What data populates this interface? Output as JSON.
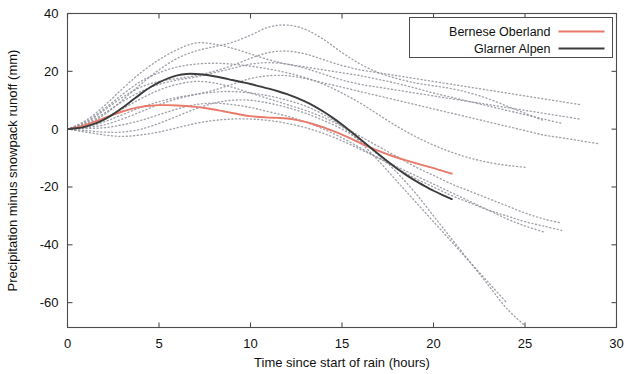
{
  "chart_data": {
    "type": "line",
    "title": "",
    "xlabel": "Time since start of rain (hours)",
    "ylabel": "Precipitation minus snowpack runoff (mm)",
    "xlim": [
      0,
      30
    ],
    "ylim": [
      -68.6,
      40
    ],
    "xticks": [
      0,
      5,
      10,
      15,
      20,
      25,
      30
    ],
    "xtick_labels": [
      "0",
      "5",
      "10",
      "15",
      "20",
      "25",
      "30"
    ],
    "yticks": [
      40,
      20,
      0,
      -20,
      -40,
      -60
    ],
    "ytick_labels": [
      "40",
      "20",
      "0",
      "-20",
      "-40",
      "-60"
    ],
    "grid": false,
    "legend_position": "top-right",
    "legend": [
      {
        "label": "Bernese Oberland",
        "color": "#e8796b",
        "style": "solid"
      },
      {
        "label": "Glarner Alpen",
        "color": "#3c3c3c",
        "style": "solid"
      }
    ],
    "series": [
      {
        "name": "Bernese Oberland",
        "role": "mean",
        "color": "#e8796b",
        "style": "solid",
        "width": 1.9,
        "x": [
          0,
          0.5,
          1,
          1.5,
          2,
          2.5,
          3,
          3.5,
          4,
          4.5,
          5,
          5.5,
          6,
          6.5,
          7,
          7.5,
          8,
          8.5,
          9,
          9.5,
          10,
          10.5,
          11,
          11.5,
          12,
          12.5,
          13,
          13.5,
          14,
          14.5,
          15,
          15.5,
          16,
          16.5,
          17,
          17.5,
          18,
          18.5,
          19,
          19.5,
          20,
          20.5,
          21
        ],
        "y": [
          0.0,
          0.6,
          1.5,
          2.6,
          3.8,
          5.0,
          6.1,
          7.0,
          7.7,
          8.1,
          8.3,
          8.3,
          8.2,
          8.0,
          7.7,
          7.3,
          6.8,
          6.2,
          5.6,
          5.0,
          4.5,
          4.2,
          4.0,
          3.9,
          3.7,
          3.2,
          2.5,
          1.6,
          0.6,
          -0.6,
          -1.9,
          -3.3,
          -4.8,
          -6.2,
          -7.5,
          -8.7,
          -9.8,
          -10.8,
          -11.7,
          -12.6,
          -13.5,
          -14.4,
          -15.4
        ]
      },
      {
        "name": "Glarner Alpen",
        "role": "mean",
        "color": "#3c3c3c",
        "style": "solid",
        "width": 1.9,
        "x": [
          0,
          0.5,
          1,
          1.5,
          2,
          2.5,
          3,
          3.5,
          4,
          4.5,
          5,
          5.5,
          6,
          6.5,
          7,
          7.5,
          8,
          8.5,
          9,
          9.5,
          10,
          10.5,
          11,
          11.5,
          12,
          12.5,
          13,
          13.5,
          14,
          14.5,
          15,
          15.5,
          16,
          16.5,
          17,
          17.5,
          18,
          18.5,
          19,
          19.5,
          20,
          20.5,
          21
        ],
        "y": [
          0.0,
          0.3,
          0.9,
          1.9,
          3.3,
          5.2,
          7.4,
          9.8,
          12.2,
          14.4,
          16.2,
          17.6,
          18.6,
          19.1,
          19.1,
          18.8,
          18.3,
          17.7,
          17.0,
          16.3,
          15.6,
          14.8,
          14.0,
          13.1,
          12.1,
          10.9,
          9.5,
          7.9,
          6.0,
          3.9,
          1.6,
          -0.9,
          -3.5,
          -6.1,
          -8.7,
          -11.2,
          -13.6,
          -15.8,
          -17.8,
          -19.6,
          -21.3,
          -22.8,
          -24.2
        ]
      },
      {
        "name": "ensemble-member-1",
        "role": "ensemble",
        "color": "#8c8f99",
        "style": "dotted",
        "width": 1.35,
        "x": [
          0,
          1,
          2,
          3,
          4,
          5,
          6,
          7,
          8,
          9,
          10,
          11,
          12,
          13,
          14,
          15,
          16,
          17,
          18,
          19,
          20,
          21,
          22,
          23,
          24,
          25,
          26,
          27
        ],
        "y": [
          0.0,
          3.0,
          8.0,
          14.0,
          19.5,
          24.0,
          27.5,
          29.8,
          29.4,
          28.0,
          26.0,
          24.0,
          22.5,
          21.5,
          20.5,
          19.5,
          18.5,
          17.2,
          15.8,
          14.2,
          12.5,
          11.0,
          9.5,
          8.0,
          6.5,
          5.0,
          3.5,
          2.0
        ]
      },
      {
        "name": "ensemble-member-2",
        "role": "ensemble",
        "color": "#8c8f99",
        "style": "dotted",
        "width": 1.35,
        "x": [
          0,
          1,
          2,
          3,
          4,
          5,
          6,
          7,
          8,
          9,
          10,
          11,
          12,
          13,
          14,
          15,
          16,
          17,
          18,
          19,
          20,
          21,
          22,
          23,
          24,
          25,
          26
        ],
        "y": [
          0.0,
          1.5,
          5.0,
          10.0,
          15.5,
          20.5,
          24.5,
          27.0,
          28.5,
          30.0,
          32.5,
          35.3,
          36.0,
          34.5,
          31.0,
          26.5,
          22.5,
          19.5,
          17.5,
          16.0,
          15.0,
          14.0,
          12.5,
          10.5,
          8.0,
          5.5,
          3.0
        ]
      },
      {
        "name": "ensemble-member-3",
        "role": "ensemble",
        "color": "#8c8f99",
        "style": "dotted",
        "width": 1.35,
        "x": [
          0,
          1,
          2,
          3,
          4,
          5,
          6,
          7,
          8,
          9,
          10,
          11,
          12,
          13,
          14,
          15,
          16,
          17,
          18,
          19,
          20,
          21,
          22,
          23,
          24,
          25
        ],
        "y": [
          0.0,
          2.5,
          7.0,
          12.0,
          16.5,
          19.5,
          21.5,
          22.5,
          22.8,
          22.5,
          21.8,
          20.8,
          19.5,
          17.8,
          15.5,
          12.5,
          9.0,
          5.0,
          1.0,
          -2.5,
          -5.5,
          -8.0,
          -10.0,
          -11.5,
          -12.5,
          -13.2
        ]
      },
      {
        "name": "ensemble-member-4",
        "role": "ensemble",
        "color": "#8c8f99",
        "style": "dotted",
        "width": 1.35,
        "x": [
          0,
          1,
          2,
          3,
          4,
          5,
          6,
          7,
          8,
          9,
          10,
          11,
          12,
          13,
          14,
          15,
          16,
          17,
          18,
          19,
          20,
          21,
          22,
          23,
          24,
          25,
          26,
          27
        ],
        "y": [
          0.0,
          1.0,
          3.5,
          7.0,
          10.5,
          13.5,
          15.5,
          16.5,
          16.0,
          14.5,
          12.5,
          10.5,
          8.5,
          6.5,
          4.0,
          1.0,
          -2.5,
          -6.0,
          -9.5,
          -13.0,
          -16.0,
          -19.0,
          -21.5,
          -24.0,
          -26.5,
          -29.0,
          -31.0,
          -32.5
        ]
      },
      {
        "name": "ensemble-member-5",
        "role": "ensemble",
        "color": "#8c8f99",
        "style": "dotted",
        "width": 1.35,
        "x": [
          0,
          1,
          2,
          3,
          4,
          5,
          6,
          7,
          8,
          9,
          10,
          11,
          12,
          13,
          14,
          15,
          16,
          17,
          18,
          19,
          20,
          21,
          22,
          23,
          24
        ],
        "y": [
          0.0,
          0.5,
          1.5,
          3.5,
          6.0,
          8.5,
          10.5,
          12.0,
          12.8,
          13.0,
          12.5,
          11.5,
          10.0,
          8.0,
          5.0,
          1.0,
          -4.5,
          -11.0,
          -18.0,
          -25.0,
          -32.0,
          -39.0,
          -46.0,
          -53.0,
          -60.0
        ]
      },
      {
        "name": "ensemble-member-6",
        "role": "ensemble",
        "color": "#8c8f99",
        "style": "dotted",
        "width": 1.35,
        "x": [
          0,
          1,
          2,
          3,
          4,
          5,
          6,
          7,
          8,
          9,
          10,
          11,
          12,
          13,
          14,
          15,
          16,
          17,
          18,
          19,
          20,
          21,
          22,
          23,
          24,
          25
        ],
        "y": [
          0.0,
          -0.5,
          -1.0,
          -1.0,
          0.0,
          2.0,
          4.5,
          7.0,
          9.0,
          10.0,
          10.0,
          9.0,
          7.5,
          5.5,
          3.0,
          0.0,
          -4.0,
          -9.0,
          -15.0,
          -22.0,
          -30.0,
          -38.0,
          -46.0,
          -54.0,
          -62.0,
          -68.0
        ]
      },
      {
        "name": "ensemble-member-7",
        "role": "ensemble",
        "color": "#8c8f99",
        "style": "dotted",
        "width": 1.35,
        "x": [
          0,
          1,
          2,
          3,
          4,
          5,
          6,
          7,
          8,
          9,
          10,
          11,
          12,
          13,
          14,
          15,
          16,
          17,
          18,
          19,
          20,
          21,
          22,
          23,
          24,
          25,
          26
        ],
        "y": [
          0.0,
          -1.0,
          -2.0,
          -2.5,
          -2.0,
          -1.0,
          0.5,
          2.0,
          3.0,
          3.5,
          3.5,
          3.0,
          2.0,
          0.5,
          -1.5,
          -4.0,
          -7.0,
          -10.0,
          -13.0,
          -16.0,
          -19.0,
          -22.0,
          -25.0,
          -28.0,
          -31.0,
          -33.5,
          -35.5
        ]
      },
      {
        "name": "ensemble-member-8",
        "role": "ensemble",
        "color": "#8c8f99",
        "style": "dotted",
        "width": 1.35,
        "x": [
          0,
          1,
          2,
          3,
          4,
          5,
          6,
          7,
          8,
          9,
          10,
          11,
          12,
          13,
          14,
          15,
          16,
          17,
          18,
          19,
          20,
          21,
          22,
          23,
          24,
          25,
          26,
          27,
          28
        ],
        "y": [
          0.0,
          1.8,
          5.5,
          9.5,
          13.0,
          15.5,
          17.0,
          18.0,
          19.5,
          21.0,
          22.5,
          23.0,
          22.5,
          21.0,
          19.0,
          17.0,
          15.5,
          14.5,
          13.5,
          12.5,
          11.5,
          10.5,
          9.5,
          8.5,
          7.5,
          6.5,
          5.5,
          4.5,
          3.5
        ]
      },
      {
        "name": "ensemble-member-9",
        "role": "ensemble",
        "color": "#8c8f99",
        "style": "dotted",
        "width": 1.35,
        "x": [
          0,
          1,
          2,
          3,
          4,
          5,
          6,
          7,
          8,
          9,
          10,
          11,
          12,
          13,
          14,
          15,
          16,
          17,
          18,
          19,
          20,
          21,
          22,
          23,
          24,
          25,
          26,
          27,
          28,
          29
        ],
        "y": [
          0.0,
          0.8,
          2.5,
          5.0,
          7.5,
          9.5,
          11.0,
          12.0,
          13.5,
          15.5,
          17.5,
          18.5,
          18.5,
          17.5,
          16.0,
          14.5,
          13.0,
          11.5,
          10.0,
          8.5,
          7.0,
          5.5,
          4.0,
          2.5,
          1.0,
          -0.5,
          -2.0,
          -3.0,
          -4.0,
          -5.0
        ]
      },
      {
        "name": "ensemble-member-10",
        "role": "ensemble",
        "color": "#8c8f99",
        "style": "dotted",
        "width": 1.35,
        "x": [
          0,
          1,
          2,
          3,
          4,
          5,
          6,
          7,
          8,
          9,
          10,
          11,
          12,
          13,
          14,
          15,
          16,
          17,
          18,
          19,
          20,
          21,
          22,
          23,
          24,
          25,
          26,
          27
        ],
        "y": [
          0.0,
          0.2,
          0.5,
          1.5,
          3.0,
          5.0,
          7.0,
          8.5,
          9.0,
          8.5,
          7.5,
          6.0,
          4.5,
          2.5,
          0.0,
          -3.0,
          -6.5,
          -10.0,
          -13.5,
          -17.0,
          -20.0,
          -23.0,
          -25.5,
          -28.0,
          -30.0,
          -32.0,
          -33.5,
          -35.0
        ]
      },
      {
        "name": "ensemble-member-11",
        "role": "ensemble",
        "color": "#8c8f99",
        "style": "dotted",
        "width": 1.35,
        "x": [
          0,
          1,
          2,
          3,
          4,
          5,
          6,
          7,
          8,
          9,
          10,
          11,
          12,
          13,
          14,
          15,
          16,
          17,
          18,
          19,
          20,
          21,
          22,
          23,
          24,
          25,
          26,
          27,
          28
        ],
        "y": [
          0.0,
          2.2,
          6.5,
          11.0,
          14.5,
          16.5,
          17.5,
          18.5,
          20.0,
          22.0,
          24.5,
          26.5,
          27.0,
          26.0,
          24.0,
          22.0,
          20.5,
          19.5,
          18.5,
          17.5,
          16.5,
          15.5,
          14.5,
          13.5,
          12.5,
          11.5,
          10.5,
          9.5,
          8.5
        ]
      }
    ]
  },
  "axis": {
    "x_title": "Time since start of rain (hours)",
    "y_title": "Precipitation minus snowpack runoff (mm)"
  }
}
